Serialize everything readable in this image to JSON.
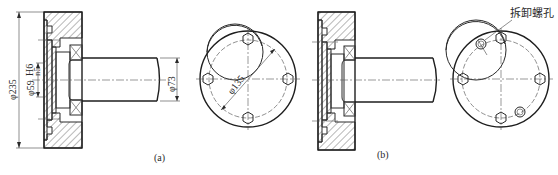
{
  "figure": {
    "view_a": {
      "caption": "(a)",
      "dim_outer": "φ235",
      "dim_fit_dia": "φ59",
      "dim_fit_hole": "H6",
      "dim_fit_shaft": "n5",
      "dim_shaft": "φ73",
      "dim_bolt_circle": "φ135"
    },
    "view_b": {
      "caption": "(b)",
      "callout": "拆卸螺孔"
    }
  }
}
